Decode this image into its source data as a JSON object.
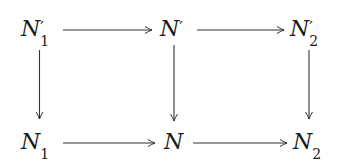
{
  "diagram": {
    "type": "commutative-diagram",
    "nodes": [
      {
        "id": "n1p",
        "base": "N",
        "prime": "′",
        "sub": "1",
        "row": 0,
        "col": 0
      },
      {
        "id": "np",
        "base": "N",
        "prime": "′",
        "sub": "",
        "row": 0,
        "col": 1
      },
      {
        "id": "n2p",
        "base": "N",
        "prime": "′",
        "sub": "2",
        "row": 0,
        "col": 2
      },
      {
        "id": "n1",
        "base": "N",
        "prime": "",
        "sub": "1",
        "row": 1,
        "col": 0
      },
      {
        "id": "n",
        "base": "N",
        "prime": "",
        "sub": "",
        "row": 1,
        "col": 1
      },
      {
        "id": "n2",
        "base": "N",
        "prime": "",
        "sub": "2",
        "row": 1,
        "col": 2
      }
    ],
    "edges": [
      {
        "from": "n1p",
        "to": "np"
      },
      {
        "from": "np",
        "to": "n2p"
      },
      {
        "from": "n1",
        "to": "n"
      },
      {
        "from": "n",
        "to": "n2"
      },
      {
        "from": "n1p",
        "to": "n1"
      },
      {
        "from": "np",
        "to": "n"
      },
      {
        "from": "n2p",
        "to": "n2"
      }
    ],
    "line_color": "#333333",
    "text_color": "#1a1a1a"
  }
}
